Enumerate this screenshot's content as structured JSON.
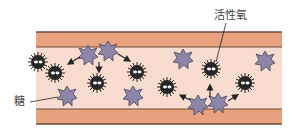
{
  "diagram": {
    "labels": {
      "sugar": "糖",
      "active_oxygen": "活性氧"
    },
    "colors": {
      "vessel_wall": "#e9a27e",
      "vessel_wall_outline": "#6b4a3a",
      "vessel_interior": "#f8dccf",
      "sugar_particle": "#8e86a8",
      "active_oxygen_particle": "#262626",
      "label_text": "#444444"
    },
    "elements": {
      "sugar_particles": 8,
      "active_oxygen_particles": 7
    }
  }
}
